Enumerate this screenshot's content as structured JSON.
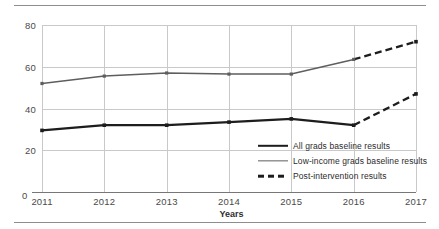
{
  "chart_data": {
    "type": "line",
    "title": "",
    "xlabel": "Years",
    "ylabel": "Annual grant (in %)",
    "categories": [
      "2011",
      "2012",
      "2013",
      "2014",
      "2015",
      "2016",
      "2017"
    ],
    "x": [
      2011,
      2012,
      2013,
      2014,
      2015,
      2016,
      2017
    ],
    "xlim": [
      2011,
      2017
    ],
    "ylim": [
      0,
      80
    ],
    "y_ticks": [
      "80",
      "60",
      "40",
      "20"
    ],
    "y_tick_values": [
      80,
      60,
      40,
      20
    ],
    "origin_tick": "0",
    "grid": "both",
    "legend_position": "inside-bottom-right",
    "series": [
      {
        "name": "All grads baseline results",
        "style": "solid",
        "width": "thick",
        "color": "#1d1d1d",
        "values": [
          29.5,
          32,
          32,
          33.5,
          35,
          32,
          null
        ],
        "markers": true
      },
      {
        "name": "Low-income grads baseline results",
        "style": "solid",
        "width": "thin",
        "color": "#5e5e5e",
        "values": [
          52,
          55.5,
          57,
          56.5,
          56.5,
          63.5,
          null
        ],
        "markers": true
      },
      {
        "name": "Post-intervention results",
        "style": "dashed",
        "width": "thick",
        "color": "#1d1d1d",
        "values_all_grads": [
          null,
          null,
          null,
          null,
          null,
          32,
          47
        ],
        "values_low_income": [
          null,
          null,
          null,
          null,
          null,
          63.5,
          72
        ],
        "markers": true
      }
    ],
    "legend": [
      {
        "label": "All grads baseline results",
        "marker": "solid-thick-line"
      },
      {
        "label": "Low-income grads baseline results",
        "marker": "solid-thin-line"
      },
      {
        "label": "Post-intervention results",
        "marker": "dashed-thick-line"
      }
    ]
  }
}
